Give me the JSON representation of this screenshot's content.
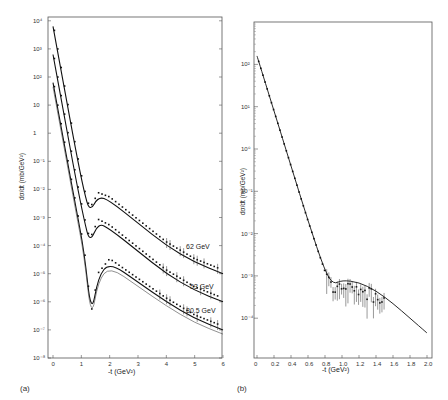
{
  "chart_data": [
    {
      "id": "a",
      "type": "scatter",
      "panel_label": "(a)",
      "xlabel": "-t (GeV²)",
      "ylabel": "dσ/dt (mb/GeV²)",
      "yscale": "log",
      "xlim": [
        0,
        6
      ],
      "ylim_exp": [
        -8,
        4
      ],
      "x_ticks": [
        "0",
        "1",
        "2",
        "3",
        "4",
        "5",
        "6"
      ],
      "y_tick_labels": [
        "10⁴",
        "10³",
        "10²",
        "10",
        "1",
        "10⁻¹",
        "10⁻²",
        "10⁻³",
        "10⁻⁴",
        "10⁻⁵",
        "10⁻⁶",
        "10⁻⁷",
        "10⁻⁸"
      ],
      "grid": false,
      "annotations": [
        "62 GeV",
        "53 GeV",
        "30.5 GeV"
      ],
      "series": [
        {
          "name": "62 GeV",
          "x": [
            0,
            0.4,
            0.8,
            1.1,
            1.3,
            1.6,
            2.0,
            3.0,
            4.0,
            5.0,
            6.0
          ],
          "log10y": [
            3.8,
            1.6,
            -0.6,
            -2.1,
            -2.8,
            -2.25,
            -2.4,
            -3.2,
            -4.0,
            -4.6,
            -5.0
          ]
        },
        {
          "name": "53 GeV",
          "x": [
            0,
            0.4,
            0.8,
            1.1,
            1.3,
            1.6,
            2.0,
            3.0,
            4.0,
            5.0,
            6.0
          ],
          "log10y": [
            2.8,
            0.6,
            -1.6,
            -3.1,
            -3.9,
            -3.2,
            -3.4,
            -4.2,
            -5.0,
            -5.6,
            -6.0
          ]
        },
        {
          "name": "30.5 GeV",
          "x": [
            0,
            0.4,
            0.8,
            1.1,
            1.35,
            1.6,
            2.0,
            3.0,
            4.0,
            5.0,
            6.0
          ],
          "log10y": [
            1.8,
            -0.4,
            -2.6,
            -4.2,
            -6.5,
            -5.1,
            -4.6,
            -5.3,
            -6.0,
            -6.6,
            -7.0
          ]
        }
      ]
    },
    {
      "id": "b",
      "type": "scatter",
      "panel_label": "(b)",
      "xlabel": "-t (GeV²)",
      "ylabel": "dσ/dt (mb/GeV²)",
      "yscale": "log",
      "xlim": [
        0,
        2.0
      ],
      "ylim_exp": [
        -4.8,
        3.0
      ],
      "x_ticks": [
        "0",
        "0.2",
        "0.4",
        "0.6",
        "0.8",
        "1.0",
        "1.2",
        "1.4",
        "1.6",
        "1.8",
        "2.0"
      ],
      "y_tick_labels": [
        "10²",
        "10¹",
        "10⁰",
        "10⁻¹",
        "10⁻²",
        "10⁻³",
        "10⁻⁴"
      ],
      "grid": false,
      "series": [
        {
          "name": "fit",
          "x": [
            0,
            0.2,
            0.4,
            0.6,
            0.8,
            0.9,
            1.0,
            1.2,
            1.4,
            1.6,
            1.8,
            2.0
          ],
          "log10y": [
            2.2,
            0.9,
            -0.4,
            -1.7,
            -2.9,
            -3.2,
            -3.1,
            -3.15,
            -3.35,
            -3.65,
            -4.0,
            -4.35
          ]
        }
      ]
    }
  ],
  "labels": {
    "panel_a": "(a)",
    "panel_b": "(b)",
    "xlabel_a": "-t  (GeV²)",
    "xlabel_b": "-t  (GeV²)",
    "ylabel_a": "dσ/dt  (mb/GeV²)",
    "ylabel_b": "dσ/dt   (mb/GeV²)",
    "energy_62": "62  GeV",
    "energy_53": "53  GeV",
    "energy_30": "30.5 GeV"
  }
}
